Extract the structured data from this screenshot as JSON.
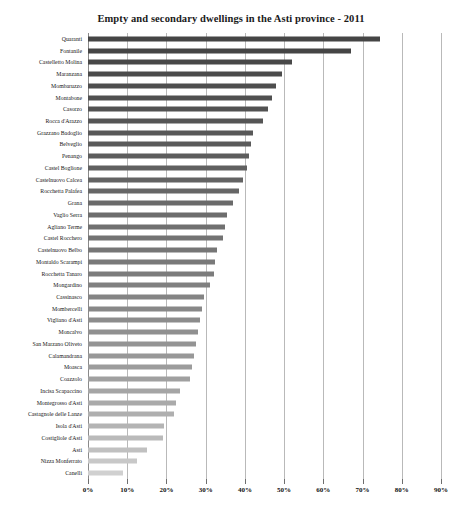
{
  "chart_data": {
    "type": "bar",
    "orientation": "horizontal",
    "title": "Empty and secondary dwellings in the Asti province - 2011",
    "xlabel": "",
    "ylabel": "",
    "xlim": [
      0,
      90
    ],
    "xtick_labels": [
      "0%",
      "10%",
      "20%",
      "30%",
      "40%",
      "50%",
      "60%",
      "70%",
      "80%",
      "90%"
    ],
    "xtick_values": [
      0,
      10,
      20,
      30,
      40,
      50,
      60,
      70,
      80,
      90
    ],
    "grid": true,
    "legend": false,
    "categories": [
      "Quaranti",
      "Fontanile",
      "Castelletto Molina",
      "Maranzana",
      "Mombaruzzo",
      "Montabone",
      "Casorzo",
      "Rocca d'Arazzo",
      "Grazzano Badoglio",
      "Belveglio",
      "Penango",
      "Castel Boglione",
      "Castelnuovo Calcea",
      "Rocchetta Palafea",
      "Grana",
      "Vaglio Serra",
      "Agliano Terme",
      "Castel Rocchero",
      "Castelnuovo Belbo",
      "Montaldo Scarampi",
      "Rocchetta Tanaro",
      "Mongardino",
      "Cassinasco",
      "Mombercelli",
      "Vigliano d'Asti",
      "Moncalvo",
      "San Marzano Oliveto",
      "Calamandrana",
      "Moasca",
      "Coazzolo",
      "Incisa Scapaccino",
      "Montegrosso d'Asti",
      "Castagnole delle Lanze",
      "Isola d'Asti",
      "Costigliole d'Asti",
      "Asti",
      "Nizza Monferrato",
      "Canelli"
    ],
    "values": [
      74.5,
      67.0,
      52.0,
      49.5,
      48.0,
      47.0,
      46.0,
      44.5,
      42.0,
      41.5,
      41.0,
      40.5,
      39.5,
      38.5,
      37.0,
      35.5,
      35.0,
      34.5,
      33.0,
      32.5,
      32.0,
      31.0,
      29.5,
      29.0,
      28.5,
      28.0,
      27.5,
      27.0,
      26.5,
      26.0,
      23.5,
      22.5,
      22.0,
      19.5,
      19.0,
      15.0,
      12.5,
      9.0
    ],
    "bar_colors": [
      "#454545",
      "#454545",
      "#484848",
      "#4b4b4b",
      "#4e4e4e",
      "#505050",
      "#525252",
      "#555555",
      "#585858",
      "#5a5a5a",
      "#5d5d5d",
      "#606060",
      "#636363",
      "#666666",
      "#6a6a6a",
      "#6d6d6d",
      "#707070",
      "#737373",
      "#767676",
      "#797979",
      "#7c7c7c",
      "#808080",
      "#848484",
      "#888888",
      "#8c8c8c",
      "#909090",
      "#949494",
      "#989898",
      "#9c9c9c",
      "#a0a0a0",
      "#a5a5a5",
      "#aaaaaa",
      "#afafaf",
      "#b4b4b4",
      "#bababa",
      "#c0c0c0",
      "#c8c8c8",
      "#d0d0d0"
    ]
  }
}
